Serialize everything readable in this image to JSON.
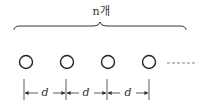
{
  "diagram": {
    "count_label": "n개",
    "spacing_label": "d",
    "circle_count_shown": 4,
    "continuation": "dashed line",
    "spacings": [
      "d",
      "d",
      "d"
    ],
    "colors": {
      "stroke": "#333333",
      "background": "#ffffff"
    }
  }
}
